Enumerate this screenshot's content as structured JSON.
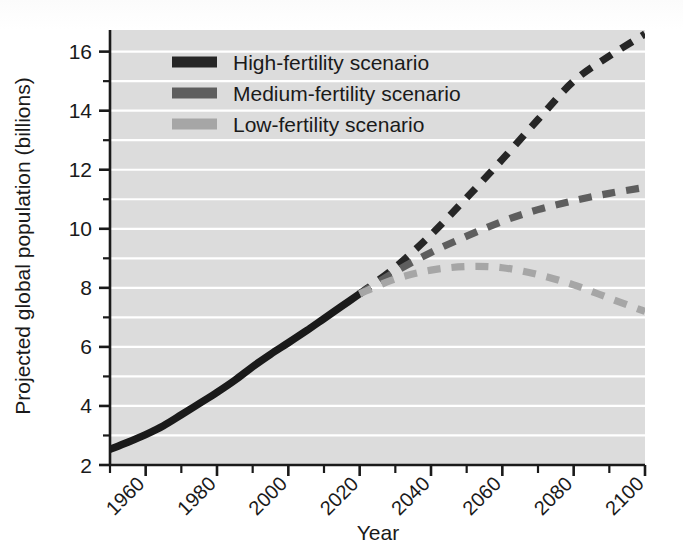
{
  "chart_data": {
    "type": "line",
    "title": "",
    "xlabel": "Year",
    "ylabel": "Projected global population (billions)",
    "xlim": [
      1950,
      2100
    ],
    "ylim": [
      2,
      16.8
    ],
    "grid": true,
    "grid_orientation": "horizontal",
    "legend_position": "top-left inside plot",
    "x_tick_labels": [
      "1960",
      "1980",
      "2000",
      "2020",
      "2040",
      "2060",
      "2080",
      "2100"
    ],
    "x_tick_values": [
      1960,
      1980,
      2000,
      2020,
      2040,
      2060,
      2080,
      2100
    ],
    "x_minor_tick_values": [
      1950,
      1970,
      1990,
      2010,
      2030,
      2050,
      2070,
      2090
    ],
    "y_tick_labels": [
      "2",
      "4",
      "6",
      "8",
      "10",
      "12",
      "14",
      "16"
    ],
    "y_tick_values": [
      2,
      4,
      6,
      8,
      10,
      12,
      14,
      16
    ],
    "y_minor_tick_values": [
      3,
      5,
      7,
      9,
      11,
      13,
      15
    ],
    "x_tick_label_rotation_deg": -45,
    "series": [
      {
        "name": "Historical",
        "style": "solid",
        "color": "#1a1a1a",
        "in_legend": false,
        "x": [
          1950,
          1955,
          1960,
          1965,
          1970,
          1975,
          1980,
          1985,
          1990,
          1995,
          2000,
          2005,
          2010,
          2015,
          2020
        ],
        "values": [
          2.53,
          2.77,
          3.03,
          3.33,
          3.7,
          4.08,
          4.46,
          4.87,
          5.33,
          5.75,
          6.14,
          6.54,
          6.96,
          7.38,
          7.8
        ]
      },
      {
        "name": "High-fertility scenario",
        "style": "dashed",
        "color": "#262626",
        "in_legend": true,
        "x": [
          2020,
          2030,
          2040,
          2050,
          2060,
          2070,
          2080,
          2090,
          2100
        ],
        "values": [
          7.8,
          8.7,
          9.8,
          11.05,
          12.35,
          13.7,
          15.0,
          15.85,
          16.6
        ]
      },
      {
        "name": "Medium-fertility scenario",
        "style": "dashed",
        "color": "#5e5e5e",
        "in_legend": true,
        "x": [
          2020,
          2030,
          2040,
          2050,
          2060,
          2070,
          2080,
          2090,
          2100
        ],
        "values": [
          7.8,
          8.55,
          9.2,
          9.75,
          10.25,
          10.65,
          10.95,
          11.2,
          11.4
        ]
      },
      {
        "name": "Low-fertility scenario",
        "style": "dashed",
        "color": "#a6a6a6",
        "in_legend": true,
        "x": [
          2020,
          2030,
          2040,
          2050,
          2060,
          2070,
          2080,
          2090,
          2100
        ],
        "values": [
          7.8,
          8.3,
          8.6,
          8.72,
          8.68,
          8.45,
          8.1,
          7.65,
          7.2
        ]
      }
    ],
    "colors": {
      "plot_background": "#dcdcdc",
      "gridline": "#ffffff",
      "axis": "#1a1a1a",
      "high_fertility": "#262626",
      "medium_fertility": "#5e5e5e",
      "low_fertility": "#a6a6a6",
      "historical": "#1a1a1a"
    }
  },
  "axes": {
    "x_title": "Year",
    "y_title": "Projected global population (billions)",
    "y_ticks": [
      {
        "label": "16",
        "value": 16
      },
      {
        "label": "14",
        "value": 14
      },
      {
        "label": "12",
        "value": 12
      },
      {
        "label": "10",
        "value": 10
      },
      {
        "label": "8",
        "value": 8
      },
      {
        "label": "6",
        "value": 6
      },
      {
        "label": "4",
        "value": 4
      },
      {
        "label": "2",
        "value": 2
      }
    ],
    "x_ticks": [
      {
        "label": "1960",
        "value": 1960
      },
      {
        "label": "1980",
        "value": 1980
      },
      {
        "label": "2000",
        "value": 2000
      },
      {
        "label": "2020",
        "value": 2020
      },
      {
        "label": "2040",
        "value": 2040
      },
      {
        "label": "2060",
        "value": 2060
      },
      {
        "label": "2080",
        "value": 2080
      },
      {
        "label": "2100",
        "value": 2100
      }
    ]
  },
  "legend": {
    "items": [
      {
        "label": "High-fertility scenario",
        "color": "#262626"
      },
      {
        "label": "Medium-fertility scenario",
        "color": "#5e5e5e"
      },
      {
        "label": "Low-fertility scenario",
        "color": "#a6a6a6"
      }
    ]
  }
}
